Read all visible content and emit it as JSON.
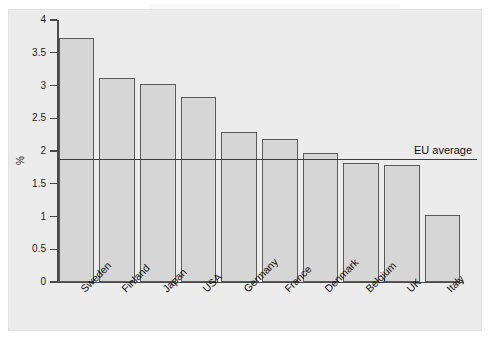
{
  "chart_data": {
    "type": "bar",
    "title": "",
    "subtitle": "",
    "xlabel": "",
    "ylabel": "%",
    "ylim": [
      0,
      4
    ],
    "ytick_labels": [
      "0",
      "0.5",
      "1",
      "1.5",
      "2",
      "2.5",
      "3",
      "3.5",
      "4"
    ],
    "ytick_values": [
      0,
      0.5,
      1,
      1.5,
      2,
      2.5,
      3,
      3.5,
      4
    ],
    "grid": false,
    "legend_position": "none",
    "categories": [
      "Sweden",
      "Finland",
      "Japan",
      "USA",
      "Germany",
      "France",
      "Denmark",
      "Belgium",
      "UK",
      "Italy"
    ],
    "values": [
      3.72,
      3.11,
      3.03,
      2.83,
      2.29,
      2.18,
      1.97,
      1.82,
      1.79,
      1.02
    ],
    "series": [
      {
        "name": "R&D expenditure as % of GDP",
        "values": [
          3.72,
          3.11,
          3.03,
          2.83,
          2.29,
          2.18,
          1.97,
          1.82,
          1.79,
          1.02
        ]
      }
    ],
    "annotations": [
      {
        "name": "eu-average",
        "label": "EU average",
        "value": 1.87,
        "orientation": "horizontal"
      }
    ],
    "colors": {
      "bar_fill": "#d6d6d6",
      "bar_edge": "#5a5a5a",
      "axis": "#4a4a4a",
      "annotation_line": "#3c3c3c",
      "plot_background": "#ececec",
      "figure_background": "#ffffff"
    }
  }
}
